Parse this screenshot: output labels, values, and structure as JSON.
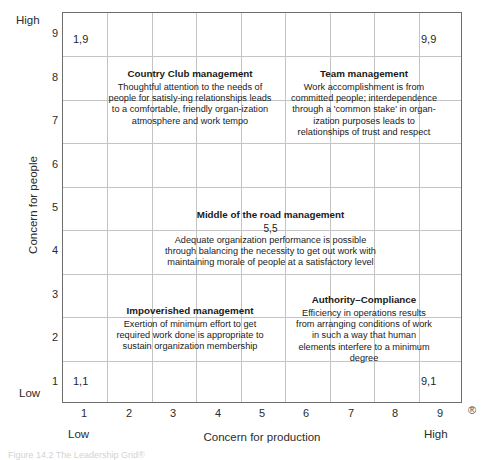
{
  "figure": {
    "registered_mark": "®",
    "caption": "Figure 14.2   The Leadership Grid®"
  },
  "axes": {
    "y": {
      "title": "Concern for people",
      "high_label": "High",
      "low_label": "Low",
      "ticks": [
        "9",
        "8",
        "7",
        "6",
        "5",
        "4",
        "3",
        "2",
        "1"
      ]
    },
    "x": {
      "title": "Concern for production",
      "low_label": "Low",
      "high_label": "High",
      "ticks": [
        "1",
        "2",
        "3",
        "4",
        "5",
        "6",
        "7",
        "8",
        "9"
      ]
    }
  },
  "corners": {
    "top_left": "1,9",
    "top_right": "9,9",
    "bottom_left": "1,1",
    "bottom_right": "9,1"
  },
  "styles": [
    {
      "key": "country-club",
      "title": "Country Club management",
      "coord": "",
      "body": "Thoughtful attention to the needs of people for satisly-ing relationships leads to a comfortable, friendly organ-ization atmosphere and work tempo"
    },
    {
      "key": "team",
      "title": "Team management",
      "coord": "",
      "body": "Work accomplishment is from committed people; interdependence through a 'common stake' in organ-ization purposes leads to relationships of trust and respect"
    },
    {
      "key": "middle-of-the-road",
      "title": "Middle of the road management",
      "coord": "5,5",
      "body": "Adequate organization performance is possible through balancing the necessity to get out work with maintaining morale of people at a satisfactory level"
    },
    {
      "key": "impoverished",
      "title": "Impoverished management",
      "coord": "",
      "body": "Exertion of minimum effort to get required work done is appropriate to sustain organization membership"
    },
    {
      "key": "authority-compliance",
      "title": "Authority–Compliance",
      "coord": "",
      "body": "Efficiency in operations results from arranging conditions of work in such a way that human elements interfere to a minimum degree"
    }
  ],
  "colors": {
    "grid_line": "#c4c4c4",
    "border": "#6e6e6e",
    "text": "#1a1a1a",
    "background": "#ffffff"
  },
  "chart_data": {
    "type": "scatter",
    "title": "The Leadership Grid",
    "xlabel": "Concern for production",
    "ylabel": "Concern for people",
    "xlim": [
      0,
      9
    ],
    "ylim": [
      0,
      9
    ],
    "xticks": [
      1,
      2,
      3,
      4,
      5,
      6,
      7,
      8,
      9
    ],
    "yticks": [
      1,
      2,
      3,
      4,
      5,
      6,
      7,
      8,
      9
    ],
    "grid": true,
    "legend": "none",
    "points": [
      {
        "label": "1,9",
        "x": 1,
        "y": 9,
        "name": "Country Club management"
      },
      {
        "label": "9,9",
        "x": 9,
        "y": 9,
        "name": "Team management"
      },
      {
        "label": "5,5",
        "x": 5,
        "y": 5,
        "name": "Middle of the road management"
      },
      {
        "label": "1,1",
        "x": 1,
        "y": 1,
        "name": "Impoverished management"
      },
      {
        "label": "9,1",
        "x": 9,
        "y": 1,
        "name": "Authority–Compliance"
      }
    ],
    "annotations": [
      {
        "text": "Country Club management",
        "x": 2.6,
        "y": 7.6
      },
      {
        "text": "Team management",
        "x": 6.6,
        "y": 7.6
      },
      {
        "text": "Middle of the road management",
        "x": 5.0,
        "y": 4.7
      },
      {
        "text": "Impoverished management",
        "x": 2.8,
        "y": 2.4
      },
      {
        "text": "Authority–Compliance",
        "x": 6.6,
        "y": 2.4
      }
    ]
  }
}
